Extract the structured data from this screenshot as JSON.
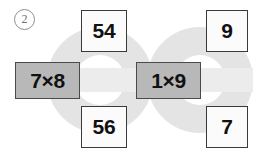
{
  "exercise": {
    "number": "2",
    "marker_icon": "circled-number-icon"
  },
  "colors": {
    "ring_fill": "#e4e4e4",
    "band_fill": "#ececec",
    "ring_hole": "#ffffff",
    "expression_fill": "#b8b8b8",
    "expression_border": "#4a4a4a",
    "answer_fill": "#fbfbfb",
    "answer_border": "#3a3a3a",
    "text": "#111111",
    "page_background": "#ffffff"
  },
  "rings": [
    {
      "name": "left-ring",
      "cx": 100,
      "cy": 80,
      "outer_r": 53,
      "inner_r": 25
    },
    {
      "name": "right-ring",
      "cx": 200,
      "cy": 80,
      "outer_r": 53,
      "inner_r": 25
    }
  ],
  "band": {
    "name": "horizontal-band",
    "x": 38,
    "y": 68,
    "width": 215,
    "height": 24
  },
  "cards": {
    "top_left": {
      "label": "54",
      "type": "answer"
    },
    "bottom_left": {
      "label": "56",
      "type": "answer"
    },
    "top_right": {
      "label": "9",
      "type": "answer"
    },
    "bottom_right": {
      "label": "7",
      "type": "answer"
    },
    "expression_left": {
      "label": "7×8",
      "type": "expression"
    },
    "expression_right": {
      "label": "1×9",
      "type": "expression"
    }
  }
}
